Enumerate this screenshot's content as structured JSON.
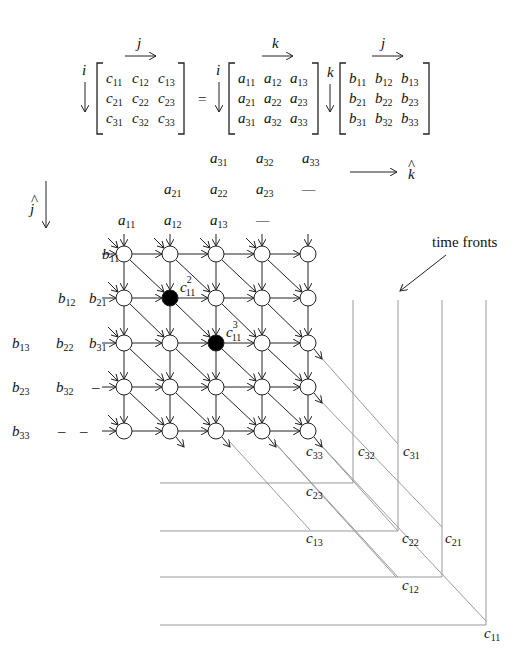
{
  "equation": {
    "C": {
      "row_label": "i",
      "col_label": "j",
      "cells": [
        [
          "c",
          "11"
        ],
        [
          "c",
          "12"
        ],
        [
          "c",
          "13"
        ],
        [
          "c",
          "21"
        ],
        [
          "c",
          "22"
        ],
        [
          "c",
          "23"
        ],
        [
          "c",
          "31"
        ],
        [
          "c",
          "32"
        ],
        [
          "c",
          "33"
        ]
      ]
    },
    "equals": "=",
    "A": {
      "row_label": "i",
      "col_label": "k",
      "cells": [
        [
          "a",
          "11"
        ],
        [
          "a",
          "12"
        ],
        [
          "a",
          "13"
        ],
        [
          "a",
          "21"
        ],
        [
          "a",
          "22"
        ],
        [
          "a",
          "23"
        ],
        [
          "a",
          "31"
        ],
        [
          "a",
          "32"
        ],
        [
          "a",
          "33"
        ]
      ]
    },
    "B": {
      "row_label": "k",
      "col_label": "j",
      "cells": [
        [
          "b",
          "11"
        ],
        [
          "b",
          "12"
        ],
        [
          "b",
          "13"
        ],
        [
          "b",
          "21"
        ],
        [
          "b",
          "22"
        ],
        [
          "b",
          "23"
        ],
        [
          "b",
          "31"
        ],
        [
          "b",
          "32"
        ],
        [
          "b",
          "33"
        ]
      ]
    }
  },
  "axes": {
    "k_hat": "k",
    "j_hat": "j",
    "hat": "^"
  },
  "a_inputs": {
    "row1": [
      [
        "a",
        "31"
      ],
      [
        "a",
        "32"
      ],
      [
        "a",
        "33"
      ]
    ],
    "row2": [
      [
        "a",
        "21"
      ],
      [
        "a",
        "22"
      ],
      [
        "a",
        "23"
      ],
      [
        "—",
        ""
      ]
    ],
    "row3": [
      [
        "a",
        "11"
      ],
      [
        "a",
        "12"
      ],
      [
        "a",
        "13"
      ],
      [
        "—",
        ""
      ]
    ]
  },
  "b_inputs": [
    [
      [
        "b",
        "11"
      ]
    ],
    [
      [
        "b",
        "12"
      ],
      [
        "b",
        "21"
      ]
    ],
    [
      [
        "b",
        "13"
      ],
      [
        "b",
        "22"
      ],
      [
        "b",
        "31"
      ]
    ],
    [
      [
        "b",
        "23"
      ],
      [
        "b",
        "32"
      ],
      [
        "–",
        ""
      ]
    ],
    [
      [
        "b",
        "33"
      ],
      [
        "–",
        ""
      ],
      [
        "–",
        ""
      ]
    ]
  ],
  "highlight_nodes": [
    {
      "row": 1,
      "col": 1,
      "label": "c",
      "sup": "2",
      "sub": "11"
    },
    {
      "row": 2,
      "col": 2,
      "label": "c",
      "sup": "3",
      "sub": "11"
    }
  ],
  "annotation": "time fronts",
  "outputs": [
    [
      "c",
      "33"
    ],
    [
      "c",
      "32"
    ],
    [
      "c",
      "31"
    ],
    [
      "c",
      "23"
    ],
    [
      "c",
      "13"
    ],
    [
      "c",
      "22"
    ],
    [
      "c",
      "21"
    ],
    [
      "c",
      "12"
    ],
    [
      "c",
      "11"
    ]
  ]
}
